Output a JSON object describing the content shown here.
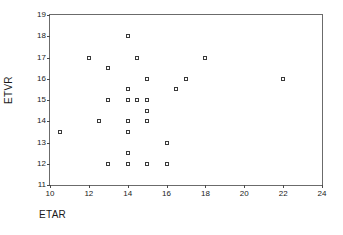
{
  "chart_data": {
    "type": "scatter",
    "title": "",
    "xlabel": "ETAR",
    "ylabel": "ETVR",
    "xlim": [
      10,
      24
    ],
    "ylim": [
      11,
      19
    ],
    "xticks": [
      10,
      12,
      14,
      16,
      18,
      20,
      22,
      24
    ],
    "yticks": [
      11,
      12,
      13,
      14,
      15,
      16,
      17,
      18,
      19
    ],
    "grid": false,
    "legend": false,
    "marker": "open-square",
    "marker_color": "#3a3a3a",
    "frame_color": "#6b6b6b",
    "background": "#ffffff",
    "points": [
      {
        "x": 10.5,
        "y": 13.5
      },
      {
        "x": 12.0,
        "y": 17.0
      },
      {
        "x": 12.5,
        "y": 14.0
      },
      {
        "x": 13.0,
        "y": 16.5
      },
      {
        "x": 13.0,
        "y": 15.0
      },
      {
        "x": 13.0,
        "y": 12.0
      },
      {
        "x": 14.0,
        "y": 18.0
      },
      {
        "x": 14.0,
        "y": 15.5
      },
      {
        "x": 14.0,
        "y": 15.0
      },
      {
        "x": 14.0,
        "y": 14.0
      },
      {
        "x": 14.0,
        "y": 13.5
      },
      {
        "x": 14.0,
        "y": 12.5
      },
      {
        "x": 14.0,
        "y": 12.0
      },
      {
        "x": 14.5,
        "y": 17.0
      },
      {
        "x": 14.5,
        "y": 15.0
      },
      {
        "x": 15.0,
        "y": 16.0
      },
      {
        "x": 15.0,
        "y": 15.0
      },
      {
        "x": 15.0,
        "y": 14.5
      },
      {
        "x": 15.0,
        "y": 14.0
      },
      {
        "x": 15.0,
        "y": 12.0
      },
      {
        "x": 16.0,
        "y": 13.0
      },
      {
        "x": 16.0,
        "y": 12.0
      },
      {
        "x": 16.5,
        "y": 15.5
      },
      {
        "x": 17.0,
        "y": 16.0
      },
      {
        "x": 18.0,
        "y": 17.0
      },
      {
        "x": 22.0,
        "y": 16.0
      }
    ]
  }
}
